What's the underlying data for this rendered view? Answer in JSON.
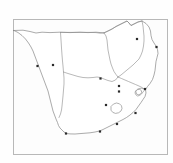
{
  "figure": {
    "type": "point-distribution-map",
    "title": "",
    "region": "Southern Africa",
    "background_color": "#fefefe",
    "frame_color": "#b8b8b8",
    "coastline_color": "#7d7d7d",
    "border_color": "#8a8a8a",
    "dot_color": "#2a2a2a",
    "frame": {
      "x": 13,
      "y": 19,
      "width": 155,
      "height": 136
    }
  },
  "chart_data": {
    "type": "scatter",
    "title": "Southern Africa sampling locality map",
    "xlabel": "",
    "ylabel": "",
    "xlim": [
      13,
      168
    ],
    "ylim": [
      19,
      155
    ],
    "grid": false,
    "legend": "none",
    "series": [
      {
        "name": "localities",
        "marker": "square",
        "marker_size": 2.2,
        "color": "#2a2a2a",
        "points": [
          {
            "x": 37.5,
            "y": 66.0,
            "label": ""
          },
          {
            "x": 53.0,
            "y": 65.0,
            "label": ""
          },
          {
            "x": 100.5,
            "y": 78.5,
            "label": ""
          },
          {
            "x": 137.0,
            "y": 39.0,
            "label": ""
          },
          {
            "x": 156.5,
            "y": 47.0,
            "label": ""
          },
          {
            "x": 119.0,
            "y": 86.0,
            "label": ""
          },
          {
            "x": 119.0,
            "y": 91.5,
            "label": ""
          },
          {
            "x": 106.0,
            "y": 105.0,
            "label": ""
          },
          {
            "x": 135.5,
            "y": 113.0,
            "label": ""
          },
          {
            "x": 117.0,
            "y": 124.0,
            "label": ""
          },
          {
            "x": 100.0,
            "y": 131.5,
            "label": ""
          },
          {
            "x": 66.0,
            "y": 133.5,
            "label": ""
          },
          {
            "x": 145.0,
            "y": 89.0,
            "label": ""
          }
        ]
      }
    ]
  },
  "map_features": {
    "outline_label": "southern-africa-coastline",
    "internal_borders_label": "country-borders",
    "enclave_labels": [
      "lesotho",
      "swaziland"
    ]
  }
}
